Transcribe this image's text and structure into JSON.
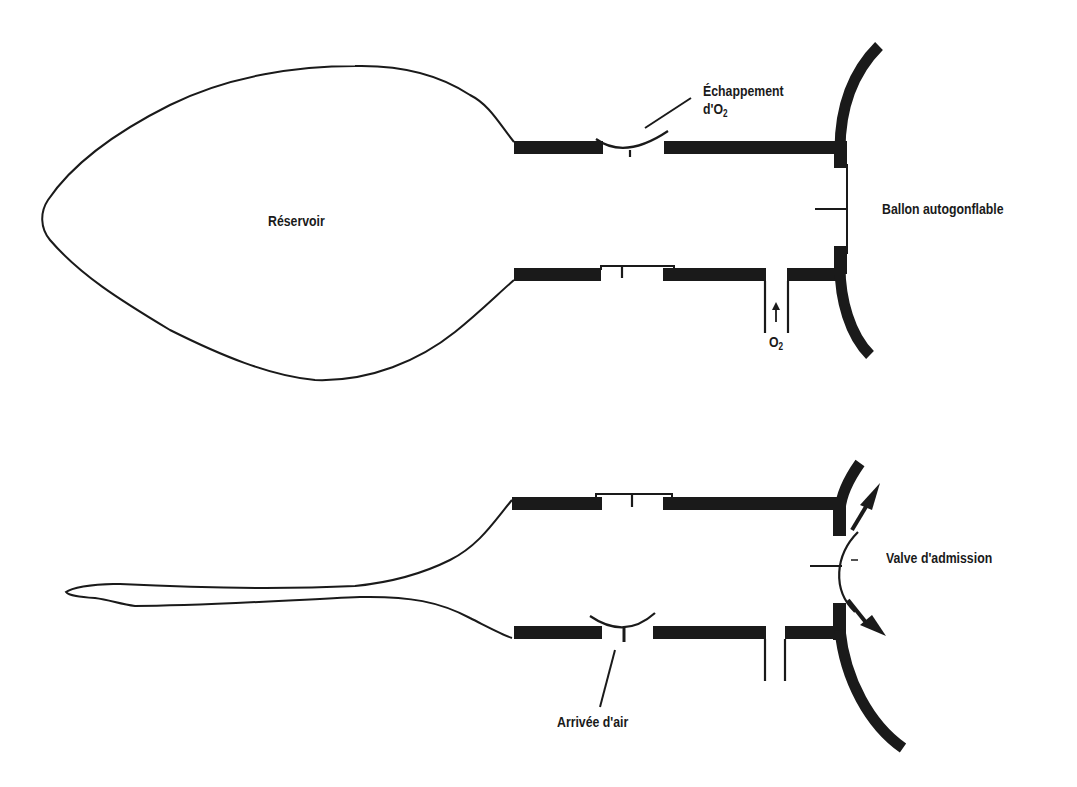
{
  "diagram": {
    "type": "bag-valve-mask with reservoir (two states)",
    "ink_color": "#1a1a1a",
    "background": "#ffffff",
    "top_panel": {
      "state": "reservoir filled",
      "labels": {
        "reservoir": "Réservoir",
        "oxygen_exhaust_line1": "Échappement",
        "oxygen_exhaust_line2_prefix": "d'O",
        "oxygen_exhaust_sub": "2",
        "self_inflating_bag": "Ballon autogonflable",
        "oxygen_inlet_prefix": "O",
        "oxygen_inlet_sub": "2"
      }
    },
    "bottom_panel": {
      "state": "reservoir collapsed",
      "labels": {
        "intake_valve": "Valve d'admission",
        "air_inlet": "Arrivée d'air"
      }
    }
  }
}
